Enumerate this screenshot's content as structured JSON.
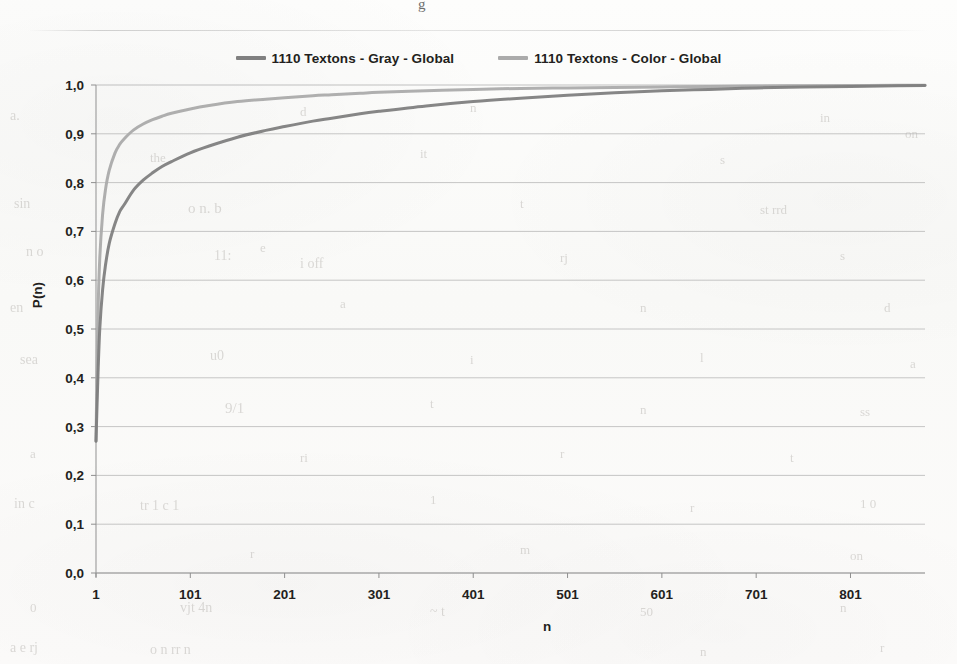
{
  "page": {
    "top_fragment": "g",
    "background_note": "scanned page"
  },
  "legend": {
    "position": "top-center",
    "entries": [
      {
        "label": "1110  Textons - Gray - Global",
        "color": "#808080",
        "icon": "line-swatch"
      },
      {
        "label": "1110  Textons - Color - Global",
        "color": "#ababab",
        "icon": "line-swatch"
      }
    ]
  },
  "axes": {
    "y": {
      "title": "P(n)",
      "ticks": [
        "0,0",
        "0,1",
        "0,2",
        "0,3",
        "0,4",
        "0,5",
        "0,6",
        "0,7",
        "0,8",
        "0,9",
        "1,0"
      ],
      "min": 0.0,
      "max": 1.0
    },
    "x": {
      "title": "n",
      "ticks": [
        "1",
        "101",
        "201",
        "301",
        "401",
        "501",
        "601",
        "701",
        "801"
      ],
      "min": 1,
      "max": 880
    }
  },
  "chart_data": {
    "type": "line",
    "title": "",
    "subtitle": "",
    "xlabel": "n",
    "ylabel": "P(n)",
    "xlim": [
      1,
      880
    ],
    "ylim": [
      0.0,
      1.0
    ],
    "xticks": [
      1,
      101,
      201,
      301,
      401,
      501,
      601,
      701,
      801
    ],
    "yticks": [
      0.0,
      0.1,
      0.2,
      0.3,
      0.4,
      0.5,
      0.6,
      0.7,
      0.8,
      0.9,
      1.0
    ],
    "ytick_labels": [
      "0,0",
      "0,1",
      "0,2",
      "0,3",
      "0,4",
      "0,5",
      "0,6",
      "0,7",
      "0,8",
      "0,9",
      "1,0"
    ],
    "grid": "horizontal",
    "legend_position": "top-center",
    "series": [
      {
        "name": "1110  Textons - Gray - Global",
        "color": "#808080",
        "x": [
          1,
          3,
          5,
          8,
          11,
          15,
          21,
          26,
          31,
          41,
          51,
          61,
          71,
          81,
          101,
          121,
          151,
          181,
          201,
          231,
          251,
          281,
          301,
          351,
          401,
          451,
          501,
          551,
          601,
          651,
          701,
          751,
          801,
          851,
          880
        ],
        "y": [
          0.27,
          0.4,
          0.5,
          0.58,
          0.63,
          0.675,
          0.715,
          0.74,
          0.755,
          0.785,
          0.805,
          0.82,
          0.833,
          0.843,
          0.861,
          0.875,
          0.893,
          0.907,
          0.915,
          0.926,
          0.932,
          0.941,
          0.946,
          0.957,
          0.966,
          0.973,
          0.979,
          0.984,
          0.988,
          0.991,
          0.994,
          0.996,
          0.997,
          0.9985,
          0.999
        ]
      },
      {
        "name": "1110  Textons - Color - Global",
        "color": "#ababab",
        "x": [
          1,
          3,
          5,
          8,
          11,
          15,
          21,
          26,
          31,
          41,
          51,
          61,
          71,
          81,
          101,
          121,
          151,
          181,
          201,
          231,
          251,
          281,
          301,
          351,
          401,
          451,
          501,
          551,
          601,
          651,
          701,
          751,
          801,
          851,
          880
        ],
        "y": [
          0.27,
          0.52,
          0.645,
          0.735,
          0.785,
          0.825,
          0.86,
          0.878,
          0.89,
          0.908,
          0.92,
          0.929,
          0.936,
          0.942,
          0.951,
          0.958,
          0.966,
          0.971,
          0.974,
          0.978,
          0.98,
          0.983,
          0.985,
          0.988,
          0.991,
          0.993,
          0.994,
          0.995,
          0.996,
          0.997,
          0.998,
          0.9985,
          0.999,
          0.9993,
          0.9995
        ]
      }
    ]
  },
  "ghosts": [
    {
      "text": "a.",
      "x": 10,
      "y": 108,
      "size": 14
    },
    {
      "text": "d",
      "x": 300,
      "y": 104,
      "size": 13
    },
    {
      "text": "n",
      "x": 470,
      "y": 100,
      "size": 13
    },
    {
      "text": "in",
      "x": 820,
      "y": 110,
      "size": 13
    },
    {
      "text": "on",
      "x": 905,
      "y": 126,
      "size": 13
    },
    {
      "text": "the",
      "x": 150,
      "y": 150,
      "size": 13
    },
    {
      "text": "it",
      "x": 420,
      "y": 146,
      "size": 13
    },
    {
      "text": "s",
      "x": 720,
      "y": 152,
      "size": 13
    },
    {
      "text": "sin",
      "x": 14,
      "y": 196,
      "size": 14
    },
    {
      "text": "o n. b",
      "x": 188,
      "y": 200,
      "size": 15
    },
    {
      "text": "t",
      "x": 520,
      "y": 196,
      "size": 13
    },
    {
      "text": "st rrd",
      "x": 760,
      "y": 202,
      "size": 13
    },
    {
      "text": "n o",
      "x": 26,
      "y": 244,
      "size": 14
    },
    {
      "text": "e",
      "x": 260,
      "y": 240,
      "size": 13
    },
    {
      "text": "11:",
      "x": 214,
      "y": 248,
      "size": 14
    },
    {
      "text": "i  off",
      "x": 300,
      "y": 256,
      "size": 14
    },
    {
      "text": "rj",
      "x": 560,
      "y": 250,
      "size": 13
    },
    {
      "text": "s",
      "x": 840,
      "y": 248,
      "size": 13
    },
    {
      "text": "en",
      "x": 10,
      "y": 300,
      "size": 14
    },
    {
      "text": "a",
      "x": 340,
      "y": 296,
      "size": 13
    },
    {
      "text": "n",
      "x": 640,
      "y": 300,
      "size": 13
    },
    {
      "text": "d",
      "x": 884,
      "y": 300,
      "size": 13
    },
    {
      "text": "sea",
      "x": 20,
      "y": 352,
      "size": 14
    },
    {
      "text": "u0",
      "x": 210,
      "y": 348,
      "size": 14
    },
    {
      "text": "i",
      "x": 470,
      "y": 352,
      "size": 13
    },
    {
      "text": "l",
      "x": 700,
      "y": 350,
      "size": 13
    },
    {
      "text": "a",
      "x": 910,
      "y": 356,
      "size": 13
    },
    {
      "text": "9/1",
      "x": 225,
      "y": 400,
      "size": 15
    },
    {
      "text": "t",
      "x": 430,
      "y": 396,
      "size": 13
    },
    {
      "text": "n",
      "x": 640,
      "y": 402,
      "size": 13
    },
    {
      "text": "ss",
      "x": 860,
      "y": 404,
      "size": 13
    },
    {
      "text": "a",
      "x": 30,
      "y": 446,
      "size": 13
    },
    {
      "text": "ri",
      "x": 300,
      "y": 450,
      "size": 13
    },
    {
      "text": "r",
      "x": 560,
      "y": 446,
      "size": 13
    },
    {
      "text": "t",
      "x": 790,
      "y": 450,
      "size": 13
    },
    {
      "text": "in   c",
      "x": 14,
      "y": 496,
      "size": 14
    },
    {
      "text": "tr 1 c 1",
      "x": 140,
      "y": 498,
      "size": 14
    },
    {
      "text": "1",
      "x": 430,
      "y": 492,
      "size": 13
    },
    {
      "text": "r",
      "x": 690,
      "y": 500,
      "size": 13
    },
    {
      "text": "1 0",
      "x": 860,
      "y": 496,
      "size": 13
    },
    {
      "text": "r",
      "x": 250,
      "y": 546,
      "size": 13
    },
    {
      "text": "m",
      "x": 520,
      "y": 542,
      "size": 13
    },
    {
      "text": "on",
      "x": 850,
      "y": 548,
      "size": 13
    },
    {
      "text": "0",
      "x": 30,
      "y": 600,
      "size": 13
    },
    {
      "text": "vjt 4n",
      "x": 180,
      "y": 600,
      "size": 14
    },
    {
      "text": "~ t",
      "x": 430,
      "y": 604,
      "size": 14
    },
    {
      "text": "50",
      "x": 640,
      "y": 604,
      "size": 13
    },
    {
      "text": "n",
      "x": 840,
      "y": 600,
      "size": 13
    },
    {
      "text": "a e  rj",
      "x": 10,
      "y": 640,
      "size": 14
    },
    {
      "text": "o n      rr    n",
      "x": 150,
      "y": 642,
      "size": 14
    },
    {
      "text": "n",
      "x": 700,
      "y": 644,
      "size": 13
    },
    {
      "text": "r",
      "x": 880,
      "y": 640,
      "size": 13
    }
  ]
}
